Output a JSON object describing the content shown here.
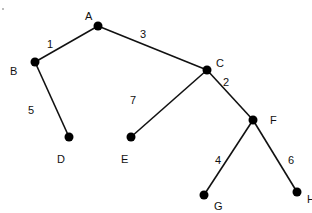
{
  "diagram": {
    "type": "weighted-tree",
    "colors": {
      "edge": "#111111",
      "node": "#000000",
      "text": "#111111",
      "background": "#ffffff"
    },
    "nodes": [
      {
        "id": "A",
        "label": "A",
        "x": 98,
        "y": 26,
        "lx": 85,
        "ly": 20
      },
      {
        "id": "B",
        "label": "B",
        "x": 35,
        "y": 62,
        "lx": 10,
        "ly": 75
      },
      {
        "id": "C",
        "label": "C",
        "x": 207,
        "y": 70,
        "lx": 216,
        "ly": 67
      },
      {
        "id": "D",
        "label": "D",
        "x": 69,
        "y": 137,
        "lx": 57,
        "ly": 163
      },
      {
        "id": "E",
        "label": "E",
        "x": 131,
        "y": 137,
        "lx": 121,
        "ly": 163
      },
      {
        "id": "F",
        "label": "F",
        "x": 253,
        "y": 120,
        "lx": 270,
        "ly": 124
      },
      {
        "id": "G",
        "label": "G",
        "x": 204,
        "y": 195,
        "lx": 214,
        "ly": 210
      },
      {
        "id": "H",
        "label": "H",
        "x": 297,
        "y": 192,
        "lx": 307,
        "ly": 203
      }
    ],
    "edges": [
      {
        "from": "A",
        "to": "B",
        "weight": "1",
        "wx": 47,
        "wy": 48
      },
      {
        "from": "A",
        "to": "C",
        "weight": "3",
        "wx": 140,
        "wy": 38
      },
      {
        "from": "B",
        "to": "D",
        "weight": "5",
        "wx": 28,
        "wy": 114
      },
      {
        "from": "C",
        "to": "E",
        "weight": "7",
        "wx": 130,
        "wy": 104
      },
      {
        "from": "C",
        "to": "F",
        "weight": "2",
        "wx": 223,
        "wy": 86
      },
      {
        "from": "F",
        "to": "G",
        "weight": "4",
        "wx": 215,
        "wy": 164
      },
      {
        "from": "F",
        "to": "H",
        "weight": "6",
        "wx": 288,
        "wy": 164
      }
    ]
  }
}
